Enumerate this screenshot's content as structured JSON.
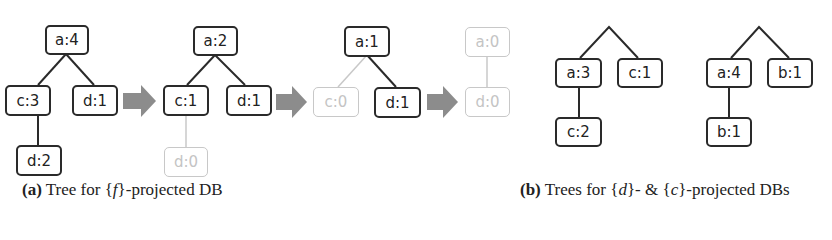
{
  "figure": {
    "panel_a": {
      "caption_label": "(a)",
      "caption_pre": "Tree for ",
      "caption_set_open": "{",
      "caption_var": "f",
      "caption_set_close": "}",
      "caption_post": "-projected DB",
      "trees": [
        {
          "nodes": [
            {
              "id": "t1-root",
              "label": "a:4",
              "faded": false
            },
            {
              "id": "t1-c",
              "label": "c:3",
              "faded": false
            },
            {
              "id": "t1-d",
              "label": "d:1",
              "faded": false
            },
            {
              "id": "t1-cd",
              "label": "d:2",
              "faded": false
            }
          ]
        },
        {
          "nodes": [
            {
              "id": "t2-root",
              "label": "a:2",
              "faded": false
            },
            {
              "id": "t2-c",
              "label": "c:1",
              "faded": false
            },
            {
              "id": "t2-d",
              "label": "d:1",
              "faded": false
            },
            {
              "id": "t2-cd",
              "label": "d:0",
              "faded": true
            }
          ]
        },
        {
          "nodes": [
            {
              "id": "t3-root",
              "label": "a:1",
              "faded": false
            },
            {
              "id": "t3-c",
              "label": "c:0",
              "faded": true
            },
            {
              "id": "t3-d",
              "label": "d:1",
              "faded": false
            }
          ]
        },
        {
          "nodes": [
            {
              "id": "t4-root",
              "label": "a:0",
              "faded": true
            },
            {
              "id": "t4-d",
              "label": "d:0",
              "faded": true
            }
          ]
        }
      ]
    },
    "panel_b": {
      "caption_label": "(b)",
      "caption_pre": "Trees for ",
      "caption_set1_open": "{",
      "caption_var1": "d",
      "caption_set1_close": "}",
      "caption_mid": "- & ",
      "caption_set2_open": "{",
      "caption_var2": "c",
      "caption_set2_close": "}",
      "caption_post": "-projected DBs",
      "trees": [
        {
          "nodes": [
            {
              "id": "b1-a",
              "label": "a:3"
            },
            {
              "id": "b1-c",
              "label": "c:1"
            },
            {
              "id": "b1-ac",
              "label": "c:2"
            }
          ]
        },
        {
          "nodes": [
            {
              "id": "b2-a",
              "label": "a:4"
            },
            {
              "id": "b2-b",
              "label": "b:1"
            },
            {
              "id": "b2-ab",
              "label": "b:1"
            }
          ]
        }
      ]
    },
    "colors": {
      "edge": "#2a2a2a",
      "faded": "#c8c8c8",
      "arrow": "#8c8c8c"
    }
  }
}
